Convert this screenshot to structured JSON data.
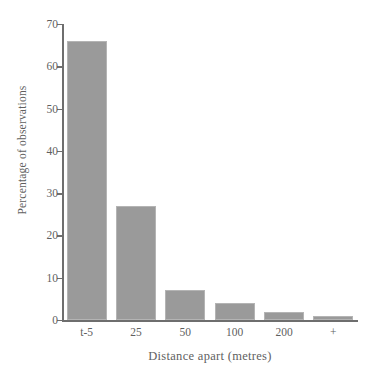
{
  "chart_data": {
    "type": "bar",
    "title": "",
    "subtitle": "",
    "categories": [
      "t-5",
      "25",
      "50",
      "100",
      "200",
      "+"
    ],
    "values": [
      66,
      27,
      7,
      4,
      2,
      1
    ],
    "xlabel": "Distance apart (metres)",
    "ylabel": "Percentage of observations",
    "ylim": [
      0,
      70
    ],
    "yticks": [
      0,
      10,
      20,
      30,
      40,
      50,
      60,
      70
    ],
    "ytick_labels": [
      "0",
      "10",
      "20",
      "30",
      "40",
      "50",
      "60",
      "70"
    ],
    "grid": false,
    "legend": null,
    "bar_color": "#9a9a9a",
    "axis_color": "#6e6e6e",
    "text_color": "#5f5f5f",
    "background": "#ffffff",
    "annotations": []
  }
}
